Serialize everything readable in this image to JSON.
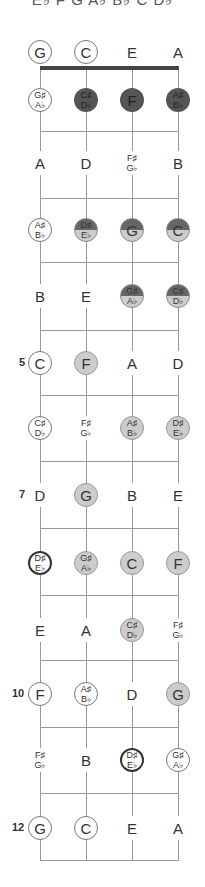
{
  "header": {
    "scale_notes": "E♭ F G A♭ B♭ C D♭"
  },
  "strings": [
    "G",
    "C",
    "E",
    "A"
  ],
  "fret_markers": [
    {
      "fret": 5,
      "label": "5"
    },
    {
      "fret": 7,
      "label": "7"
    },
    {
      "fret": 10,
      "label": "10"
    },
    {
      "fret": 12,
      "label": "12"
    }
  ],
  "legend": {
    "plain": "not in scale",
    "ring": "open / reference note",
    "root": "root note",
    "dark": "chord tone (dark)",
    "light": "scale tone (light)",
    "split": "dark + light"
  },
  "colors": {
    "dark": "#555555",
    "light": "#cccccc",
    "line": "#999999",
    "nut": "#444444"
  },
  "frets": [
    {
      "fret": 0,
      "notes": [
        {
          "label": [
            "G"
          ],
          "style": "ring"
        },
        {
          "label": [
            "C"
          ],
          "style": "ring"
        },
        {
          "label": [
            "E"
          ],
          "style": "plain"
        },
        {
          "label": [
            "A"
          ],
          "style": "plain"
        }
      ]
    },
    {
      "fret": 1,
      "notes": [
        {
          "label": [
            "G♯",
            "A♭"
          ],
          "style": "ring"
        },
        {
          "label": [
            "C♯",
            "D♭"
          ],
          "style": "dark"
        },
        {
          "label": [
            "F"
          ],
          "style": "dark"
        },
        {
          "label": [
            "A♯",
            "B♭"
          ],
          "style": "dark"
        }
      ]
    },
    {
      "fret": 2,
      "notes": [
        {
          "label": [
            "A"
          ],
          "style": "plain"
        },
        {
          "label": [
            "D"
          ],
          "style": "plain"
        },
        {
          "label": [
            "F♯",
            "G♭"
          ],
          "style": "plain"
        },
        {
          "label": [
            "B"
          ],
          "style": "plain"
        }
      ]
    },
    {
      "fret": 3,
      "notes": [
        {
          "label": [
            "A♯",
            "B♭"
          ],
          "style": "ring"
        },
        {
          "label": [
            "D♯",
            "E♭"
          ],
          "style": "split-root"
        },
        {
          "label": [
            "G"
          ],
          "style": "split"
        },
        {
          "label": [
            "C"
          ],
          "style": "split"
        }
      ]
    },
    {
      "fret": 4,
      "notes": [
        {
          "label": [
            "B"
          ],
          "style": "plain"
        },
        {
          "label": [
            "E"
          ],
          "style": "plain"
        },
        {
          "label": [
            "G♯",
            "A♭"
          ],
          "style": "split"
        },
        {
          "label": [
            "C♯",
            "D♭"
          ],
          "style": "split"
        }
      ]
    },
    {
      "fret": 5,
      "notes": [
        {
          "label": [
            "C"
          ],
          "style": "ring"
        },
        {
          "label": [
            "F"
          ],
          "style": "light"
        },
        {
          "label": [
            "A"
          ],
          "style": "plain"
        },
        {
          "label": [
            "D"
          ],
          "style": "plain"
        }
      ]
    },
    {
      "fret": 6,
      "notes": [
        {
          "label": [
            "C♯",
            "D♭"
          ],
          "style": "ring"
        },
        {
          "label": [
            "F♯",
            "G♭"
          ],
          "style": "plain"
        },
        {
          "label": [
            "A♯",
            "B♭"
          ],
          "style": "light"
        },
        {
          "label": [
            "D♯",
            "E♭"
          ],
          "style": "light-root"
        }
      ]
    },
    {
      "fret": 7,
      "notes": [
        {
          "label": [
            "D"
          ],
          "style": "plain"
        },
        {
          "label": [
            "G"
          ],
          "style": "light"
        },
        {
          "label": [
            "B"
          ],
          "style": "plain"
        },
        {
          "label": [
            "E"
          ],
          "style": "plain"
        }
      ]
    },
    {
      "fret": 8,
      "notes": [
        {
          "label": [
            "D♯",
            "E♭"
          ],
          "style": "root"
        },
        {
          "label": [
            "G♯",
            "A♭"
          ],
          "style": "light"
        },
        {
          "label": [
            "C"
          ],
          "style": "light"
        },
        {
          "label": [
            "F"
          ],
          "style": "light"
        }
      ]
    },
    {
      "fret": 9,
      "notes": [
        {
          "label": [
            "E"
          ],
          "style": "plain"
        },
        {
          "label": [
            "A"
          ],
          "style": "plain"
        },
        {
          "label": [
            "C♯",
            "D♭"
          ],
          "style": "light"
        },
        {
          "label": [
            "F♯",
            "G♭"
          ],
          "style": "plain"
        }
      ]
    },
    {
      "fret": 10,
      "notes": [
        {
          "label": [
            "F"
          ],
          "style": "ring"
        },
        {
          "label": [
            "A♯",
            "B♭"
          ],
          "style": "ring"
        },
        {
          "label": [
            "D"
          ],
          "style": "plain"
        },
        {
          "label": [
            "G"
          ],
          "style": "light"
        }
      ]
    },
    {
      "fret": 11,
      "notes": [
        {
          "label": [
            "F♯",
            "G♭"
          ],
          "style": "plain"
        },
        {
          "label": [
            "B"
          ],
          "style": "plain"
        },
        {
          "label": [
            "D♯",
            "E♭"
          ],
          "style": "root"
        },
        {
          "label": [
            "G♯",
            "A♭"
          ],
          "style": "ring"
        }
      ]
    },
    {
      "fret": 12,
      "notes": [
        {
          "label": [
            "G"
          ],
          "style": "ring"
        },
        {
          "label": [
            "C"
          ],
          "style": "ring"
        },
        {
          "label": [
            "E"
          ],
          "style": "plain"
        },
        {
          "label": [
            "A"
          ],
          "style": "plain"
        }
      ]
    }
  ]
}
